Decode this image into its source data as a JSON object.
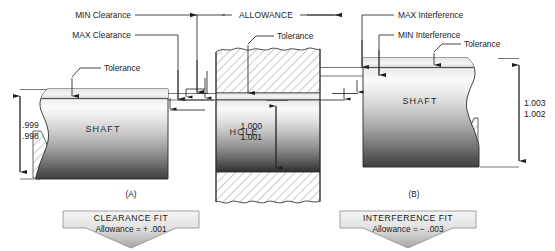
{
  "figure": {
    "type": "engineering-drawing"
  },
  "labels": {
    "min_clearance": "MIN Clearance",
    "max_clearance": "MAX Clearance",
    "allowance": "ALLOWANCE",
    "max_interference": "MAX Interference",
    "min_interference": "MIN Interference",
    "tolerance_left": "Tolerance",
    "tolerance_hole": "Tolerance",
    "tolerance_right": "Tolerance"
  },
  "parts": {
    "shaft_left": {
      "name": "SHAFT",
      "dim_upper": ".999",
      "dim_lower": ".998"
    },
    "hole": {
      "name": "HOLE",
      "dim_upper": "1.000",
      "dim_lower": "1.001"
    },
    "shaft_right": {
      "name": "SHAFT",
      "dim_upper": "1.003",
      "dim_lower": "1.002"
    }
  },
  "figure_labels": {
    "left": "(A)",
    "right": "(B)"
  },
  "banners": [
    {
      "id": "clearance-fit",
      "title": "CLEARANCE FIT",
      "subtitle": "Allowance = + .001"
    },
    {
      "id": "interference-fit",
      "title": "INTERFERENCE FIT",
      "subtitle": "Allowance = − .003"
    }
  ],
  "colors": {
    "line": "#262626",
    "text": "#1a1a1a",
    "metal_light": "#f2f2f2",
    "metal_mid": "#b9b9b9",
    "metal_dark": "#3a3a3a",
    "hatch_fill": "#ffffff",
    "banner_light": "#f0f0f0",
    "banner_dark": "#a8a8a8",
    "background": "#ffffff"
  }
}
